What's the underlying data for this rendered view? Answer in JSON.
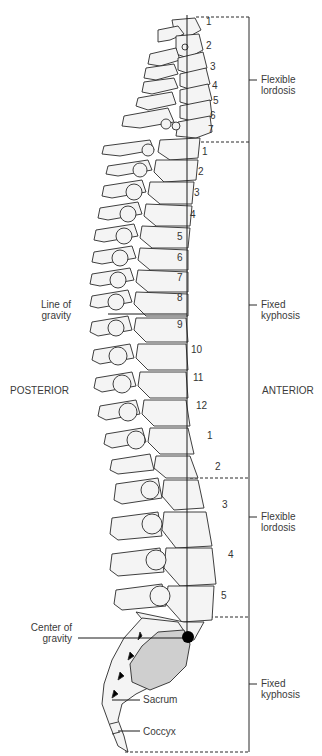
{
  "diagram": {
    "orientation": {
      "left": "POSTERIOR",
      "right": "ANTERIOR"
    },
    "regions": [
      {
        "name": "cervical",
        "curve_line1": "Flexible",
        "curve_line2": "lordosis",
        "vertebrae": [
          "1",
          "2",
          "3",
          "4",
          "5",
          "6",
          "7"
        ]
      },
      {
        "name": "thoracic",
        "curve_line1": "Fixed",
        "curve_line2": "kyphosis",
        "vertebrae": [
          "1",
          "2",
          "3",
          "4",
          "5",
          "6",
          "7",
          "8",
          "9",
          "10",
          "11",
          "12"
        ]
      },
      {
        "name": "lumbar",
        "curve_line1": "Flexible",
        "curve_line2": "lordosis",
        "vertebrae": [
          "1",
          "2",
          "3",
          "4",
          "5"
        ]
      },
      {
        "name": "sacral",
        "curve_line1": "Fixed",
        "curve_line2": "kyphosis",
        "vertebrae": []
      }
    ],
    "callouts": {
      "line_of_gravity_1": "Line of",
      "line_of_gravity_2": "gravity",
      "center_of_gravity_1": "Center of",
      "center_of_gravity_2": "gravity",
      "sacrum": "Sacrum",
      "coccyx": "Coccyx"
    },
    "colors": {
      "line": "#2a2a2a",
      "bone_fill": "#f4f4f4",
      "sacrum_shade": "#cfcfcf",
      "dot": "#000000"
    }
  }
}
